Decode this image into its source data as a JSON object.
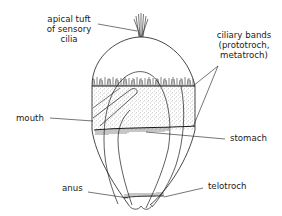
{
  "figure": {
    "colors": {
      "line": "#1a1a1a",
      "stipple": "#555555",
      "background": "#ffffff"
    },
    "labels": {
      "apical_tuft": [
        "apical tuft",
        "of sensory",
        "cilia"
      ],
      "ciliary_bands": [
        "ciliary bands",
        "(prototroch,",
        "metatroch)"
      ],
      "mouth": "mouth",
      "stomach": "stomach",
      "anus": "anus",
      "telotroch": "telotroch"
    }
  }
}
